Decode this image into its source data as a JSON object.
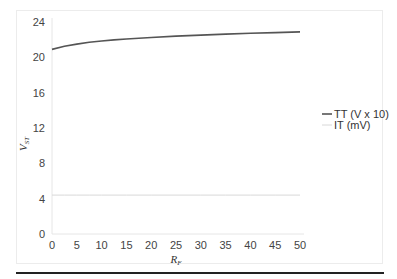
{
  "chart_data": {
    "type": "line",
    "title": "",
    "xlabel": "R_F",
    "ylabel": "V_ST",
    "xlim": [
      0,
      50
    ],
    "ylim": [
      0,
      24
    ],
    "xticks": [
      0,
      5,
      10,
      15,
      20,
      25,
      30,
      35,
      40,
      45,
      50
    ],
    "yticks": [
      0,
      4,
      8,
      12,
      16,
      20,
      24
    ],
    "grid": false,
    "legend_position": "right",
    "x": [
      0,
      2.5,
      5,
      7.5,
      10,
      12.5,
      15,
      20,
      25,
      30,
      35,
      40,
      45,
      50
    ],
    "series": [
      {
        "name": "TT (V x 10)",
        "color": "#555555",
        "values": [
          20.9,
          21.25,
          21.5,
          21.7,
          21.85,
          21.97,
          22.07,
          22.25,
          22.4,
          22.52,
          22.63,
          22.72,
          22.8,
          22.88
        ]
      },
      {
        "name": "IT (mV)",
        "color": "#d8d8d8",
        "values": [
          4.4,
          4.4,
          4.4,
          4.4,
          4.4,
          4.4,
          4.4,
          4.4,
          4.4,
          4.4,
          4.4,
          4.4,
          4.4,
          4.4
        ]
      }
    ]
  },
  "labels": {
    "xlabel_main": "R",
    "xlabel_sub": "F",
    "ylabel_main": "V",
    "ylabel_sub": "ST",
    "legend": [
      "TT (V x 10)",
      "IT (mV)"
    ]
  }
}
